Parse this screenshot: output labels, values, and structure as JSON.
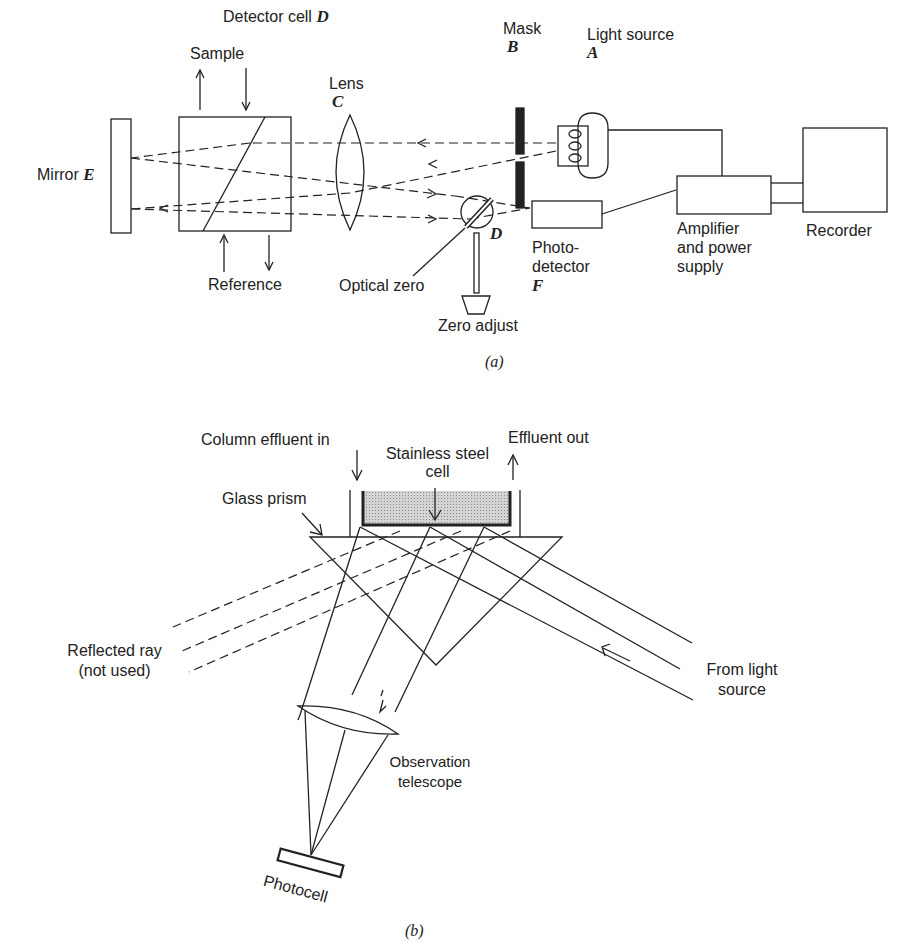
{
  "panel_a": {
    "title": "Detector cell",
    "title_letter": "D",
    "sample": "Sample",
    "reference": "Reference",
    "mirror": "Mirror",
    "mirror_letter": "E",
    "lens": "Lens",
    "lens_letter": "C",
    "mask": "Mask",
    "mask_letter": "B",
    "light_source": "Light source",
    "light_source_letter": "A",
    "optical_zero": "Optical zero",
    "d_letter": "D",
    "zero_adjust": "Zero adjust",
    "photodetector_l1": "Photo-",
    "photodetector_l2": "detector",
    "photodetector_letter": "F",
    "amplifier_l1": "Amplifier",
    "amplifier_l2": "and power",
    "amplifier_l3": "supply",
    "recorder": "Recorder",
    "caption": "(a)"
  },
  "panel_b": {
    "column_effluent_in": "Column effluent in",
    "stainless_l1": "Stainless steel",
    "stainless_l2": "cell",
    "effluent_out": "Effluent out",
    "glass_prism": "Glass prism",
    "reflected_l1": "Reflected ray",
    "reflected_l2": "(not used)",
    "from_light_l1": "From light",
    "from_light_l2": "source",
    "observation_l1": "Observation",
    "observation_l2": "telescope",
    "photocell": "Photocell",
    "caption": "(b)"
  }
}
